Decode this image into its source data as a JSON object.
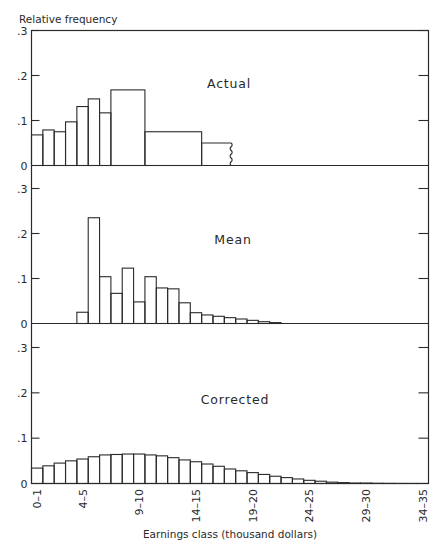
{
  "chart_data": {
    "type": "bar",
    "title": "",
    "ylabel": "Relative frequency",
    "xlabel": "Earnings class (thousand dollars)",
    "x_range": [
      0,
      35
    ],
    "ylim": [
      0,
      0.3
    ],
    "y_ticks": [
      ".3",
      ".2",
      ".1",
      "0"
    ],
    "x_tick_labels": [
      "0–1",
      "4–5",
      "9–10",
      "14–15",
      "19–20",
      "24–25",
      "29–30",
      "34–35"
    ],
    "x_tick_positions": [
      0.5,
      4.5,
      9.5,
      14.5,
      19.5,
      24.5,
      29.5,
      34.5
    ],
    "grid": false,
    "panels": [
      {
        "name": "Actual",
        "bins": [
          {
            "from": 0,
            "to": 1,
            "value": 0.068
          },
          {
            "from": 1,
            "to": 2,
            "value": 0.079
          },
          {
            "from": 2,
            "to": 3,
            "value": 0.075
          },
          {
            "from": 3,
            "to": 4,
            "value": 0.097
          },
          {
            "from": 4,
            "to": 5,
            "value": 0.131
          },
          {
            "from": 5,
            "to": 6,
            "value": 0.148
          },
          {
            "from": 6,
            "to": 7,
            "value": 0.117
          },
          {
            "from": 7,
            "to": 10,
            "value": 0.168
          },
          {
            "from": 10,
            "to": 15,
            "value": 0.075
          },
          {
            "from": 15,
            "to": 17.6,
            "value": 0.05,
            "open_ended": true
          }
        ]
      },
      {
        "name": "Mean",
        "bins": [
          {
            "from": 4,
            "to": 5,
            "value": 0.025
          },
          {
            "from": 5,
            "to": 6,
            "value": 0.235
          },
          {
            "from": 6,
            "to": 7,
            "value": 0.104
          },
          {
            "from": 7,
            "to": 8,
            "value": 0.067
          },
          {
            "from": 8,
            "to": 9,
            "value": 0.123
          },
          {
            "from": 9,
            "to": 10,
            "value": 0.048
          },
          {
            "from": 10,
            "to": 11,
            "value": 0.104
          },
          {
            "from": 11,
            "to": 12,
            "value": 0.079
          },
          {
            "from": 12,
            "to": 13,
            "value": 0.077
          },
          {
            "from": 13,
            "to": 14,
            "value": 0.046
          },
          {
            "from": 14,
            "to": 15,
            "value": 0.024
          },
          {
            "from": 15,
            "to": 16,
            "value": 0.019
          },
          {
            "from": 16,
            "to": 17,
            "value": 0.016
          },
          {
            "from": 17,
            "to": 18,
            "value": 0.013
          },
          {
            "from": 18,
            "to": 19,
            "value": 0.01
          },
          {
            "from": 19,
            "to": 20,
            "value": 0.007
          },
          {
            "from": 20,
            "to": 21,
            "value": 0.004
          },
          {
            "from": 21,
            "to": 22,
            "value": 0.002
          }
        ]
      },
      {
        "name": "Corrected",
        "bins": [
          {
            "from": 0,
            "to": 1,
            "value": 0.034
          },
          {
            "from": 1,
            "to": 2,
            "value": 0.039
          },
          {
            "from": 2,
            "to": 3,
            "value": 0.045
          },
          {
            "from": 3,
            "to": 4,
            "value": 0.05
          },
          {
            "from": 4,
            "to": 5,
            "value": 0.054
          },
          {
            "from": 5,
            "to": 6,
            "value": 0.059
          },
          {
            "from": 6,
            "to": 7,
            "value": 0.063
          },
          {
            "from": 7,
            "to": 8,
            "value": 0.064
          },
          {
            "from": 8,
            "to": 9,
            "value": 0.065
          },
          {
            "from": 9,
            "to": 10,
            "value": 0.065
          },
          {
            "from": 10,
            "to": 11,
            "value": 0.063
          },
          {
            "from": 11,
            "to": 12,
            "value": 0.061
          },
          {
            "from": 12,
            "to": 13,
            "value": 0.057
          },
          {
            "from": 13,
            "to": 14,
            "value": 0.052
          },
          {
            "from": 14,
            "to": 15,
            "value": 0.048
          },
          {
            "from": 15,
            "to": 16,
            "value": 0.043
          },
          {
            "from": 16,
            "to": 17,
            "value": 0.038
          },
          {
            "from": 17,
            "to": 18,
            "value": 0.032
          },
          {
            "from": 18,
            "to": 19,
            "value": 0.028
          },
          {
            "from": 19,
            "to": 20,
            "value": 0.024
          },
          {
            "from": 20,
            "to": 21,
            "value": 0.02
          },
          {
            "from": 21,
            "to": 22,
            "value": 0.016
          },
          {
            "from": 22,
            "to": 23,
            "value": 0.013
          },
          {
            "from": 23,
            "to": 24,
            "value": 0.01
          },
          {
            "from": 24,
            "to": 25,
            "value": 0.007
          },
          {
            "from": 25,
            "to": 26,
            "value": 0.005
          },
          {
            "from": 26,
            "to": 27,
            "value": 0.003
          },
          {
            "from": 27,
            "to": 28,
            "value": 0.002
          },
          {
            "from": 28,
            "to": 29,
            "value": 0.001
          },
          {
            "from": 29,
            "to": 30,
            "value": 0.001
          },
          {
            "from": 30,
            "to": 31,
            "value": 0.0005
          },
          {
            "from": 31,
            "to": 32,
            "value": 0.0003
          },
          {
            "from": 32,
            "to": 33,
            "value": 0.0002
          },
          {
            "from": 33,
            "to": 34,
            "value": 0.0001
          },
          {
            "from": 34,
            "to": 35,
            "value": 0.0001
          }
        ]
      }
    ]
  },
  "labels": {
    "ylabel": "Relative frequency",
    "xlabel": "Earnings class (thousand dollars)"
  },
  "colors": {
    "ink": "#2a2a2a",
    "background": "#ffffff"
  }
}
